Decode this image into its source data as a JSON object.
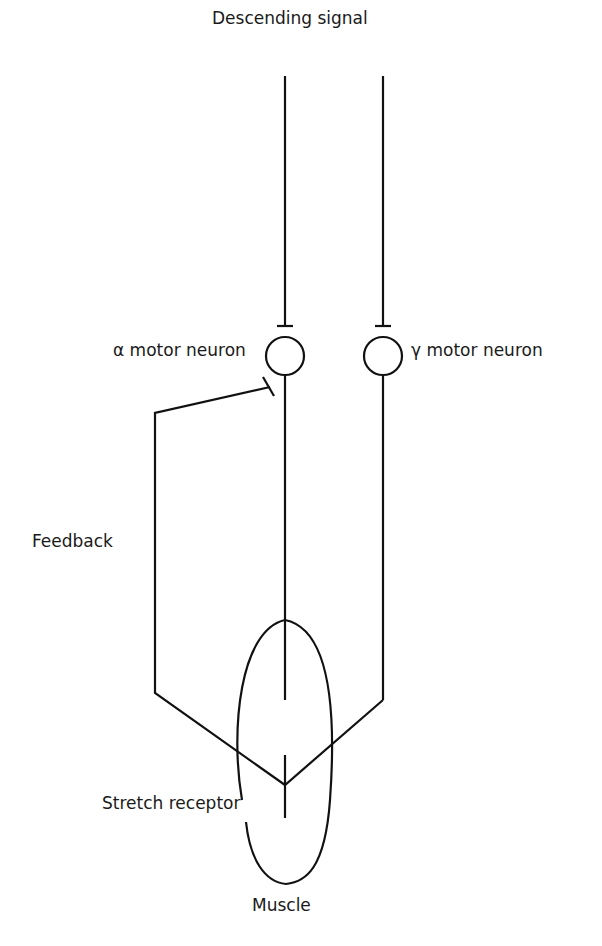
{
  "diagram": {
    "title": "Descending signal",
    "labels": {
      "descending_signal": "Descending signal",
      "alpha_motor_neuron": "α motor neuron",
      "gamma_motor_neuron": "γ motor neuron",
      "feedback": "Feedback",
      "stretch_receptor": "Stretch receptor",
      "muscle": "Muscle"
    },
    "colors": {
      "stroke": "#111111",
      "text": "#1a1a1a",
      "background": "#ffffff"
    }
  }
}
